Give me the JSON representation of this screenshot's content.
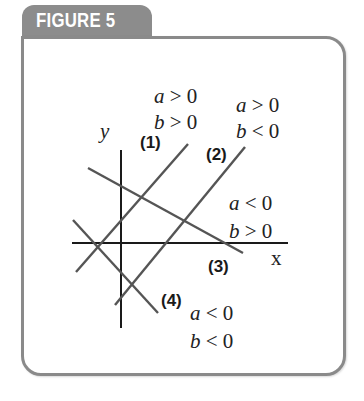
{
  "figure": {
    "title": "FIGURE 5",
    "frame_color": "#8a8a8a",
    "tab_color": "#8c8c8c"
  },
  "axes": {
    "x_label": "x",
    "y_label": "y"
  },
  "lines": [
    {
      "id": "1",
      "label": "(1)",
      "a_condition": "a > 0",
      "b_condition": "b > 0",
      "a_var": "a",
      "a_rel": " > 0",
      "b_var": "b",
      "b_rel": " > 0"
    },
    {
      "id": "2",
      "label": "(2)",
      "a_condition": "a > 0",
      "b_condition": "b < 0",
      "a_var": "a",
      "a_rel": " > 0",
      "b_var": "b",
      "b_rel": " < 0"
    },
    {
      "id": "3",
      "label": "(3)",
      "a_condition": "a < 0",
      "b_condition": "b > 0",
      "a_var": "a",
      "a_rel": " < 0",
      "b_var": "b",
      "b_rel": " > 0"
    },
    {
      "id": "4",
      "label": "(4)",
      "a_condition": "a < 0",
      "b_condition": "b < 0",
      "a_var": "a",
      "a_rel": " < 0",
      "b_var": "b",
      "b_rel": " < 0"
    }
  ],
  "colors": {
    "axis": "#1a1a1a",
    "line": "#555555"
  }
}
